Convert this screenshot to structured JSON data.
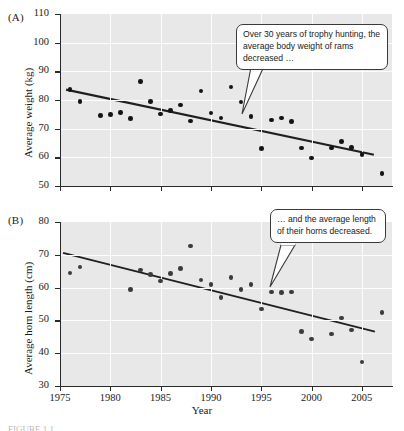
{
  "figure": {
    "panel_a_label": "(A)",
    "panel_b_label": "(B)",
    "x_axis_title": "Year",
    "caption_partial": "FIGURE 1.1 ..."
  },
  "callouts": {
    "a": "Over 30 years of trophy hunting, the average body weight of rams decreased …",
    "b": "… and the average length of their horns decreased."
  },
  "chart_data": [
    {
      "type": "scatter",
      "panel": "A",
      "title": "",
      "xlabel": "Year",
      "ylabel": "Average weight (kg)",
      "xlim": [
        1975,
        2008
      ],
      "ylim": [
        50,
        110
      ],
      "xticks": [
        1975,
        1980,
        1985,
        1990,
        1995,
        2000,
        2005
      ],
      "yticks": [
        50,
        60,
        70,
        80,
        90,
        100,
        110
      ],
      "grid": true,
      "legend": "none",
      "points": [
        {
          "x": 1976,
          "y": 83.7
        },
        {
          "x": 1977,
          "y": 79.5
        },
        {
          "x": 1979,
          "y": 74.6
        },
        {
          "x": 1980,
          "y": 74.9
        },
        {
          "x": 1981,
          "y": 75.6
        },
        {
          "x": 1982,
          "y": 73.6
        },
        {
          "x": 1983,
          "y": 86.5
        },
        {
          "x": 1984,
          "y": 79.5
        },
        {
          "x": 1985,
          "y": 75.1
        },
        {
          "x": 1986,
          "y": 76.3
        },
        {
          "x": 1987,
          "y": 78.3
        },
        {
          "x": 1988,
          "y": 72.7
        },
        {
          "x": 1989,
          "y": 83.1
        },
        {
          "x": 1990,
          "y": 75.4
        },
        {
          "x": 1991,
          "y": 73.7
        },
        {
          "x": 1992,
          "y": 84.6
        },
        {
          "x": 1993,
          "y": 79.3
        },
        {
          "x": 1994,
          "y": 74.2
        },
        {
          "x": 1995,
          "y": 63.1
        },
        {
          "x": 1996,
          "y": 73.0
        },
        {
          "x": 1997,
          "y": 73.7
        },
        {
          "x": 1998,
          "y": 72.4
        },
        {
          "x": 1999,
          "y": 63.2
        },
        {
          "x": 2000,
          "y": 59.7
        },
        {
          "x": 2002,
          "y": 63.3
        },
        {
          "x": 2003,
          "y": 65.6
        },
        {
          "x": 2004,
          "y": 63.4
        },
        {
          "x": 2005,
          "y": 61.0
        },
        {
          "x": 2007,
          "y": 54.4
        }
      ],
      "trendline": {
        "x0": 1975.6,
        "y0": 83.6,
        "x1": 2006.2,
        "y1": 60.9
      }
    },
    {
      "type": "scatter",
      "panel": "B",
      "title": "",
      "xlabel": "Year",
      "ylabel": "Average horn length (cm)",
      "xlim": [
        1975,
        2008
      ],
      "ylim": [
        30,
        80
      ],
      "xticks": [
        1975,
        1980,
        1985,
        1990,
        1995,
        2000,
        2005
      ],
      "yticks": [
        30,
        40,
        50,
        60,
        70,
        80
      ],
      "grid": true,
      "legend": "none",
      "points": [
        {
          "x": 1976,
          "y": 64.4
        },
        {
          "x": 1977,
          "y": 66.3
        },
        {
          "x": 1982,
          "y": 59.4
        },
        {
          "x": 1983,
          "y": 65.4
        },
        {
          "x": 1984,
          "y": 64.0
        },
        {
          "x": 1985,
          "y": 62.0
        },
        {
          "x": 1986,
          "y": 64.3
        },
        {
          "x": 1987,
          "y": 65.9
        },
        {
          "x": 1988,
          "y": 72.7
        },
        {
          "x": 1989,
          "y": 62.3
        },
        {
          "x": 1990,
          "y": 61.0
        },
        {
          "x": 1991,
          "y": 56.9
        },
        {
          "x": 1992,
          "y": 63.1
        },
        {
          "x": 1993,
          "y": 59.4
        },
        {
          "x": 1994,
          "y": 61.0
        },
        {
          "x": 1995,
          "y": 53.5
        },
        {
          "x": 1996,
          "y": 58.6
        },
        {
          "x": 1997,
          "y": 58.5
        },
        {
          "x": 1998,
          "y": 58.7
        },
        {
          "x": 1999,
          "y": 46.6
        },
        {
          "x": 2000,
          "y": 44.3
        },
        {
          "x": 2002,
          "y": 45.9
        },
        {
          "x": 2003,
          "y": 50.7
        },
        {
          "x": 2004,
          "y": 47.1
        },
        {
          "x": 2005,
          "y": 37.3
        },
        {
          "x": 2007,
          "y": 52.4
        }
      ],
      "trendline": {
        "x0": 1975.3,
        "y0": 70.6,
        "x1": 2006.3,
        "y1": 46.6
      }
    }
  ],
  "colors": {
    "plot_background": "#e8e8e8",
    "gridline": "#fdfdfd",
    "axis": "#2a2a2a",
    "dot_a": "#141414",
    "dot_b": "#3b3b3b",
    "callout_border": "#3a3a3a",
    "callout_fill": "#ffffff"
  }
}
